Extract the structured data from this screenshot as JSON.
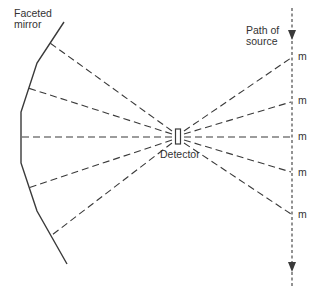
{
  "labels": {
    "mirror": [
      "Faceted",
      "mirror"
    ],
    "source": [
      "Path of",
      "source"
    ],
    "detector": "Detector",
    "marker": "m"
  },
  "colors": {
    "line": "#3a3a3a",
    "background": "#ffffff"
  },
  "geometry": {
    "mirror_points": [
      [
        64,
        22
      ],
      [
        37,
        63
      ],
      [
        21,
        112
      ],
      [
        21,
        163
      ],
      [
        37,
        211
      ],
      [
        67,
        264
      ]
    ],
    "detector": {
      "x": 175.5,
      "y": 129,
      "w": 5,
      "h": 15
    },
    "source_path": {
      "x": 292,
      "y1": 8,
      "y2": 286
    },
    "rays_left": [
      [
        50,
        43
      ],
      [
        28,
        88
      ],
      [
        21,
        137
      ],
      [
        28,
        188
      ],
      [
        52,
        235
      ]
    ],
    "rays_right": [
      [
        292,
        58
      ],
      [
        292,
        102
      ],
      [
        292,
        137
      ],
      [
        292,
        172
      ],
      [
        292,
        214
      ]
    ]
  }
}
